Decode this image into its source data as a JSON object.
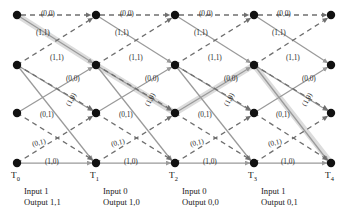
{
  "diagram": {
    "type": "trellis",
    "colors": {
      "node": "#111111",
      "solid_edge": "#9a9a9a",
      "dashed_edge": "#7d7d7d",
      "highlight_path": "#d9d9d9",
      "text": "#1a1a1a",
      "background": "#ffffff"
    },
    "rows": 4,
    "columns": 5,
    "time_labels": [
      "T",
      "T",
      "T",
      "T",
      "T"
    ],
    "time_subscripts": [
      "0",
      "1",
      "2",
      "3",
      "4"
    ],
    "stages": [
      {
        "input_label": "Input 1",
        "output_label": "Output 1,1"
      },
      {
        "input_label": "Input 0",
        "output_label": "Output 1,0"
      },
      {
        "input_label": "Input 0",
        "output_label": "Output 0,0"
      },
      {
        "input_label": "Input 1",
        "output_label": "Output 0,1"
      }
    ],
    "edge_labels": {
      "top_row": [
        "(0,0)",
        "(0,0)",
        "(0,0)",
        "(0,0)"
      ],
      "row0_to_row1_diagonal": [
        "(1,1)",
        "(1,1)",
        "(1,1)",
        "(1,1)"
      ],
      "row1_up_diagonal": [
        "(1,1)",
        "(1,1)",
        "(1,1)",
        "(1,1)"
      ],
      "row1_row_label": [
        "(0,0)",
        "(0,0)",
        "(0,0)",
        "(0,0)"
      ],
      "row2_down_label": [
        "(1,0)",
        "(1,0)",
        "(1,0)",
        "(1,0)"
      ],
      "row2_row_label": [
        "(0,1)",
        "(0,1)",
        "(0,1)",
        "(0,1)"
      ],
      "row3_up_label": [
        "(0,1)",
        "(0,1)",
        "(0,1)",
        "(0,1)"
      ],
      "bottom_row": [
        "(1,0)",
        "(1,0)",
        "(1,0)",
        "(1,0)"
      ]
    }
  }
}
